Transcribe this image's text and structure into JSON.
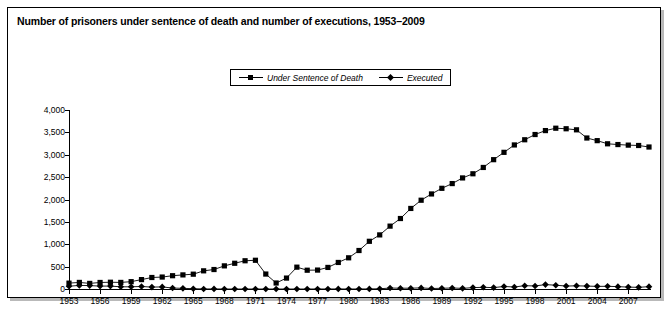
{
  "title": "Number of prisoners under sentence of death and number of executions, 1953–2009",
  "legend": {
    "position": "top-center",
    "entries": [
      {
        "label": "Under Sentence of Death",
        "marker": "square-marker-icon"
      },
      {
        "label": "Executed",
        "marker": "diamond-marker-icon"
      }
    ]
  },
  "chart_data": {
    "type": "line",
    "title": "Number of prisoners under sentence of death and number of executions, 1953–2009",
    "xlabel": "",
    "ylabel": "",
    "xlim": [
      1953,
      2009
    ],
    "ylim": [
      0,
      4000
    ],
    "grid": false,
    "legend_position": "top-center",
    "ytick_labels": [
      "0",
      "500",
      "1,000",
      "1,500",
      "2,000",
      "2,500",
      "3,000",
      "3,500",
      "4,000"
    ],
    "ytick_values": [
      0,
      500,
      1000,
      1500,
      2000,
      2500,
      3000,
      3500,
      4000
    ],
    "xtick_labels": [
      "1953",
      "1956",
      "1959",
      "1962",
      "1965",
      "1968",
      "1971",
      "1974",
      "1977",
      "1980",
      "1983",
      "1986",
      "1989",
      "1992",
      "1995",
      "1998",
      "2001",
      "2004",
      "2007"
    ],
    "xtick_values": [
      1953,
      1956,
      1959,
      1962,
      1965,
      1968,
      1971,
      1974,
      1977,
      1980,
      1983,
      1986,
      1989,
      1992,
      1995,
      1998,
      2001,
      2004,
      2007
    ],
    "x": [
      1953,
      1954,
      1955,
      1956,
      1957,
      1958,
      1959,
      1960,
      1961,
      1962,
      1963,
      1964,
      1965,
      1966,
      1967,
      1968,
      1969,
      1970,
      1971,
      1972,
      1973,
      1974,
      1975,
      1976,
      1977,
      1978,
      1979,
      1980,
      1981,
      1982,
      1983,
      1984,
      1985,
      1986,
      1987,
      1988,
      1989,
      1990,
      1991,
      1992,
      1993,
      1994,
      1995,
      1996,
      1997,
      1998,
      1999,
      2000,
      2001,
      2002,
      2003,
      2004,
      2005,
      2006,
      2007,
      2008,
      2009
    ],
    "series": [
      {
        "name": "Under Sentence of Death",
        "marker": "square",
        "values": [
          131,
          147,
          125,
          146,
          151,
          147,
          164,
          210,
          257,
          267,
          297,
          315,
          331,
          406,
          435,
          517,
          575,
          631,
          642,
          334,
          134,
          244,
          488,
          420,
          423,
          482,
          593,
          697,
          860,
          1066,
          1209,
          1405,
          1575,
          1800,
          1984,
          2124,
          2250,
          2356,
          2482,
          2575,
          2716,
          2890,
          3054,
          3219,
          3335,
          3452,
          3540,
          3593,
          3581,
          3557,
          3374,
          3315,
          3245,
          3228,
          3215,
          3207,
          3173
        ]
      },
      {
        "name": "Executed",
        "marker": "diamond",
        "values": [
          62,
          81,
          76,
          65,
          65,
          49,
          49,
          56,
          42,
          47,
          21,
          15,
          7,
          1,
          2,
          0,
          0,
          0,
          0,
          0,
          0,
          0,
          0,
          0,
          1,
          0,
          2,
          0,
          1,
          2,
          5,
          21,
          18,
          18,
          25,
          11,
          16,
          23,
          14,
          31,
          38,
          31,
          56,
          45,
          74,
          68,
          98,
          85,
          66,
          71,
          65,
          59,
          60,
          53,
          42,
          37,
          52
        ]
      }
    ]
  }
}
